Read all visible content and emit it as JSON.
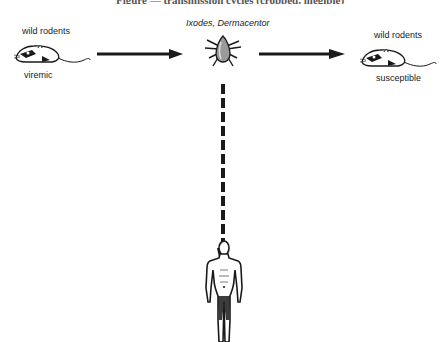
{
  "diagram": {
    "title_cropped": "Figure — transmission cycles (cropped, illegible)",
    "vector": {
      "label": "Ixodes, Dermacentor",
      "icon": "tick-icon"
    },
    "source_host": {
      "top_label": "wild rodents",
      "bottom_label": "viremic",
      "icon": "rodent-icon"
    },
    "target_host": {
      "top_label": "wild rodents",
      "bottom_label": "susceptible",
      "icon": "rodent-icon"
    },
    "human": {
      "icon": "human-figure-icon"
    },
    "edges": [
      {
        "from": "source_host",
        "to": "vector",
        "style": "solid"
      },
      {
        "from": "vector",
        "to": "target_host",
        "style": "solid"
      },
      {
        "from": "vector",
        "to": "human",
        "style": "dashed"
      }
    ],
    "colors": {
      "ink": "#1a1a1a",
      "background": "#ffffff"
    }
  }
}
